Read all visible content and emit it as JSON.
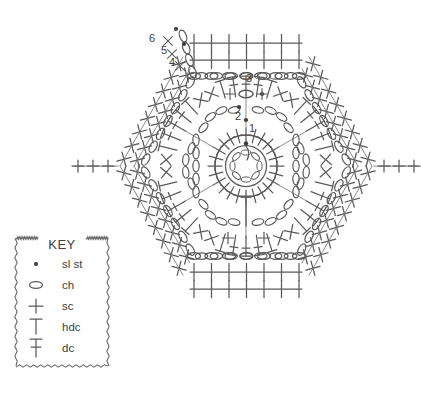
{
  "diagram": {
    "type": "crochet-stitch-chart",
    "shape": "hexagon-motif",
    "stroke_color": "#5a5a5a",
    "background_color": "#ffffff",
    "round_labels": [
      {
        "id": "1",
        "text": "1",
        "x": 252,
        "y": 132
      },
      {
        "id": "2",
        "text": "2",
        "x": 238,
        "y": 120
      },
      {
        "id": "3",
        "text": "3",
        "x": 249,
        "y": 82
      },
      {
        "id": "4",
        "text": "4",
        "x": 172,
        "y": 66
      },
      {
        "id": "5",
        "text": "5",
        "x": 164,
        "y": 54
      },
      {
        "id": "6",
        "text": "6",
        "x": 152,
        "y": 42
      }
    ]
  },
  "key": {
    "title": "KEY",
    "box": {
      "x": 16,
      "y": 238,
      "width": 92,
      "height": 128
    },
    "entries": [
      {
        "symbol": "sl-st-dot",
        "label": "sl st"
      },
      {
        "symbol": "ch-oval",
        "label": "ch"
      },
      {
        "symbol": "sc-cross",
        "label": "sc"
      },
      {
        "symbol": "hdc-bar",
        "label": "hdc"
      },
      {
        "symbol": "dc-bar-crossed",
        "label": "dc"
      }
    ]
  }
}
